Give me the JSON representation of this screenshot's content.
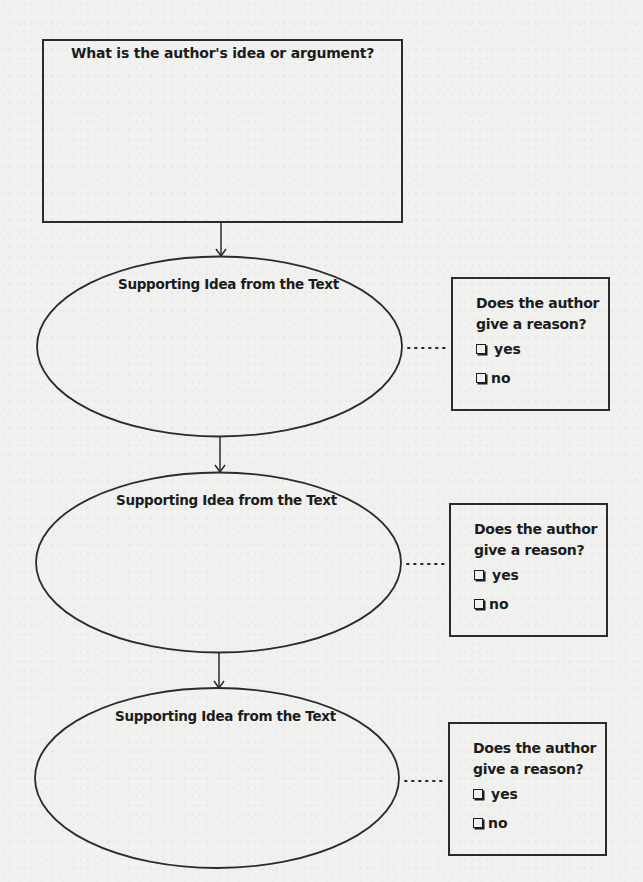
{
  "main_question": {
    "title": "What is the author's idea or argument?"
  },
  "supporting_ideas": [
    {
      "label": "Supporting Idea from the Text",
      "reason_box": {
        "question_line1": "Does the author",
        "question_line2": "give a reason?",
        "options": [
          {
            "icon": "checkbox-icon",
            "label": "yes",
            "checked": false
          },
          {
            "icon": "checkbox-icon",
            "label": "no",
            "checked": false
          }
        ]
      }
    },
    {
      "label": "Supporting Idea from the Text",
      "reason_box": {
        "question_line1": "Does the author",
        "question_line2": "give a reason?",
        "options": [
          {
            "icon": "checkbox-icon",
            "label": "yes",
            "checked": false
          },
          {
            "icon": "checkbox-icon",
            "label": "no",
            "checked": false
          }
        ]
      }
    },
    {
      "label": "Supporting Idea from the Text",
      "reason_box": {
        "question_line1": "Does the author",
        "question_line2": "give a reason?",
        "options": [
          {
            "icon": "checkbox-icon",
            "label": "yes",
            "checked": false
          },
          {
            "icon": "checkbox-icon",
            "label": "no",
            "checked": false
          }
        ]
      }
    }
  ],
  "colors": {
    "background": "#f1f1f0",
    "stroke": "#2b2b2b",
    "text": "#1c1c1c"
  }
}
